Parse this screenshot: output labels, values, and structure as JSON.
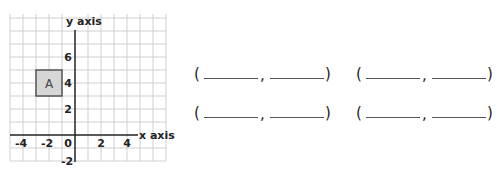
{
  "graph": {
    "x_axis_label": "x axis",
    "y_axis_label": "y axis",
    "x_tick_labels": [
      "-4",
      "-2",
      "0",
      "2",
      "4"
    ],
    "y_tick_labels": [
      "6",
      "4",
      "2",
      "-2"
    ],
    "shape": {
      "label": "A",
      "x_min": -3,
      "x_max": -1,
      "y_min": 3,
      "y_max": 5,
      "fill": "#d6d6d6",
      "stroke": "#555555"
    },
    "grid_color": "#cfcfcf",
    "axis_color": "#222222"
  },
  "answers": {
    "open_paren": "(",
    "close_paren": ")",
    "comma": ",",
    "pairs": [
      {
        "x_value": "",
        "y_value": ""
      },
      {
        "x_value": "",
        "y_value": ""
      },
      {
        "x_value": "",
        "y_value": ""
      },
      {
        "x_value": "",
        "y_value": ""
      }
    ]
  }
}
